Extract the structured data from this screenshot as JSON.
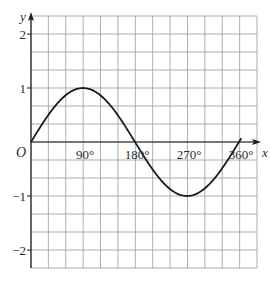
{
  "chart_data": {
    "type": "line",
    "title": "",
    "function": "y = sin x",
    "xlabel": "x",
    "ylabel": "y",
    "origin_label": "O",
    "x_tick_labels": [
      "90°",
      "180°",
      "270°",
      "360°"
    ],
    "x_tick_values": [
      90,
      180,
      270,
      360
    ],
    "y_tick_labels": [
      "2",
      "1",
      "−1",
      "−2"
    ],
    "y_tick_values": [
      2,
      1,
      -1,
      -2
    ],
    "xlim": [
      0,
      390
    ],
    "ylim": [
      -2.33,
      2.33
    ],
    "grid": true,
    "grid_step_x": 30,
    "grid_step_y": 0.3333,
    "legend": null,
    "series": [
      {
        "name": "sin x",
        "x": [
          0,
          30,
          60,
          90,
          120,
          150,
          180,
          210,
          240,
          270,
          300,
          330,
          360
        ],
        "y": [
          0,
          0.5,
          0.866,
          1,
          0.866,
          0.5,
          0,
          -0.5,
          -0.866,
          -1,
          -0.866,
          -0.5,
          0
        ]
      }
    ],
    "colors": {
      "grid": "#9a9a9a",
      "axis": "#1a1a1a",
      "curve": "#1a1a1a",
      "text": "#2b2b2b"
    }
  }
}
